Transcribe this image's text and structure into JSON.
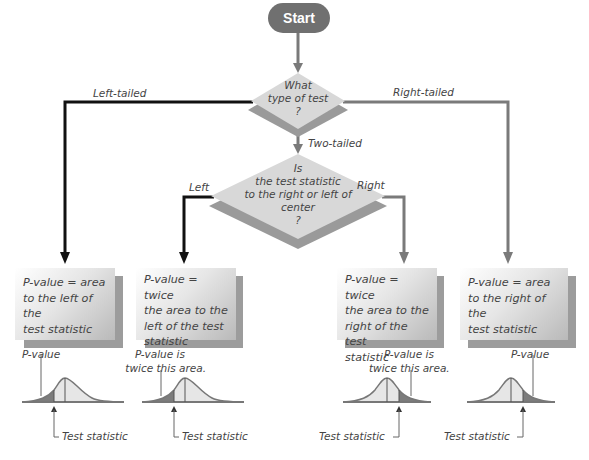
{
  "flowchart": {
    "start": {
      "label": "Start",
      "color": "#707070"
    },
    "decision_1": {
      "lines": [
        "What",
        "type of test",
        "?"
      ]
    },
    "decision_2": {
      "lines": [
        "Is",
        "the test statistic",
        "to the right or left of",
        "center",
        "?"
      ]
    },
    "branches": {
      "left_tailed": "Left-tailed",
      "right_tailed": "Right-tailed",
      "two_tailed": "Two-tailed",
      "left": "Left",
      "right": "Right"
    },
    "outcomes": [
      {
        "id": "left-tailed",
        "lines": [
          "P-value = area",
          "to the left of the",
          "test statistic"
        ]
      },
      {
        "id": "two-tailed-left",
        "lines": [
          "P-value = twice",
          "the area to the",
          "left of the test",
          "statistic"
        ]
      },
      {
        "id": "two-tailed-right",
        "lines": [
          "P-value = twice",
          "the area to the",
          "right of the test",
          "statistic"
        ]
      },
      {
        "id": "right-tailed",
        "lines": [
          "P-value = area",
          "to the right of the",
          "test statistic"
        ]
      }
    ],
    "curves": [
      {
        "shaded_side": "left",
        "area_label": [
          "P-value"
        ],
        "stat_label": "Test statistic"
      },
      {
        "shaded_side": "left",
        "area_label": [
          "P-value is",
          "twice this area."
        ],
        "stat_label": "Test statistic"
      },
      {
        "shaded_side": "right",
        "area_label": [
          "P-value is",
          "twice this area."
        ],
        "stat_label": "Test statistic"
      },
      {
        "shaded_side": "right",
        "area_label": [
          "P-value"
        ],
        "stat_label": "Test statistic"
      }
    ],
    "colors": {
      "left_path": "#111111",
      "right_path": "#7a7a7a",
      "diamond": "#d9d9d9",
      "diamond_shadow": "#9a9a9a",
      "curve_fill_light": "#e6e6e6",
      "curve_fill_dark": "#7c7c7c",
      "curve_line": "#777777"
    }
  }
}
